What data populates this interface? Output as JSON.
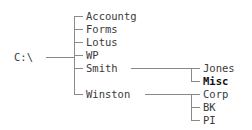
{
  "diagram": {
    "kind": "directory-tree",
    "root": {
      "label": "C:\\",
      "x": 14,
      "y": 57
    },
    "colors": {
      "line": "#8a8a8a",
      "text": "#3a3a3a",
      "selected_text": "#111111",
      "background": "#ffffff"
    },
    "level1": [
      {
        "label": "Accountg",
        "x": 86,
        "y": 10
      },
      {
        "label": "Forms",
        "x": 86,
        "y": 23
      },
      {
        "label": "Lotus",
        "x": 86,
        "y": 36
      },
      {
        "label": "WP",
        "x": 86,
        "y": 49
      },
      {
        "label": "Smith",
        "x": 86,
        "y": 62
      },
      {
        "label": "Winston",
        "x": 86,
        "y": 88
      }
    ],
    "smith_children": [
      {
        "label": "Jones",
        "x": 203,
        "y": 62,
        "selected": false
      },
      {
        "label": "Misc",
        "x": 203,
        "y": 75,
        "selected": true
      }
    ],
    "winston_children": [
      {
        "label": "Corp",
        "x": 203,
        "y": 88,
        "selected": false
      },
      {
        "label": "BK",
        "x": 203,
        "y": 101,
        "selected": false
      },
      {
        "label": "PI",
        "x": 203,
        "y": 114,
        "selected": false
      }
    ]
  }
}
